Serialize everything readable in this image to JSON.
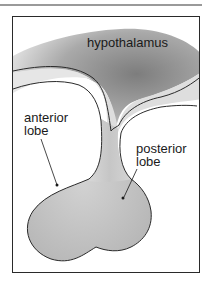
{
  "figure": {
    "type": "anatomical-diagram",
    "labels": {
      "hypothalamus": "hypothalamus",
      "anterior_lobe_line1": "anterior",
      "anterior_lobe_line2": "lobe",
      "posterior_lobe_line1": "posterior",
      "posterior_lobe_line2": "lobe"
    },
    "colors": {
      "hypothalamus_shade": "#8c8c8c",
      "gland_fill": "#c8c8c8",
      "outline": "#2a2a2a",
      "frame": "#2a2a2a",
      "rule": "#9a9a9a"
    }
  }
}
